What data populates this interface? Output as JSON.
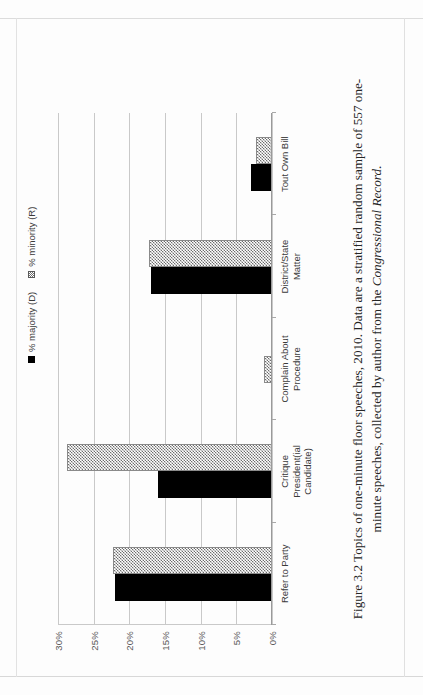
{
  "figure": {
    "caption_prefix": "Figure 3.2",
    "caption_text": "Figure 3.2 Topics of one-minute floor speeches, 2010. Data are a stratified random sample of 557 one-minute speeches, collected by author from the ",
    "caption_source": "Congressional Record",
    "caption_end": "."
  },
  "legend": {
    "position": "top-right",
    "items": [
      {
        "label": "% majority (D)",
        "swatch": "solid-black-square",
        "color": "#000000"
      },
      {
        "label": "% minority (R)",
        "swatch": "hatched-gray-square",
        "color": "#6e6e6e"
      }
    ]
  },
  "axis": {
    "y_ticks": [
      "0%",
      "5%",
      "10%",
      "15%",
      "20%",
      "25%",
      "30%"
    ],
    "y_tick_values": [
      0,
      5,
      10,
      15,
      20,
      25,
      30
    ]
  },
  "chart_data": {
    "type": "bar",
    "title": "",
    "xlabel": "",
    "ylabel": "",
    "ylim": [
      0,
      30
    ],
    "grid": true,
    "legend_position": "top-right",
    "categories": [
      "Refer to Party",
      "Critique\nPresident(ial\nCandidate)",
      "Complain About\nProcedure",
      "District/State\nMatter",
      "Tout Own Bill"
    ],
    "tick_labels": [
      "0%",
      "5%",
      "10%",
      "15%",
      "20%",
      "25%",
      "30%"
    ],
    "series": [
      {
        "name": "% majority (D)",
        "color": "#000000",
        "values": [
          22.0,
          16.0,
          0.0,
          17.0,
          3.0
        ]
      },
      {
        "name": "% minority (R)",
        "color": "#6e6e6e",
        "values": [
          22.3,
          28.7,
          1.1,
          17.3,
          2.3
        ]
      }
    ]
  }
}
